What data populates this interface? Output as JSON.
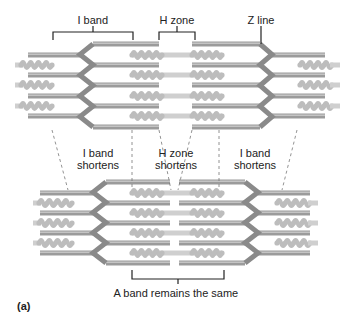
{
  "labels": {
    "top": [
      {
        "id": "i-band",
        "text": "I band",
        "x": 93,
        "y": 14
      },
      {
        "id": "h-zone",
        "text": "H zone",
        "x": 177,
        "y": 14
      },
      {
        "id": "z-line",
        "text": "Z line",
        "x": 261,
        "y": 14
      }
    ],
    "middle": [
      {
        "id": "i-band-shortens-left",
        "line1": "I band",
        "line2": "shortens",
        "x": 98,
        "y": 147
      },
      {
        "id": "h-zone-shortens",
        "line1": "H zone",
        "line2": "shortens",
        "x": 176,
        "y": 147
      },
      {
        "id": "i-band-shortens-right",
        "line1": "I band",
        "line2": "shortens",
        "x": 255,
        "y": 147
      }
    ],
    "bottom": {
      "text": "A band remains the same",
      "x": 176,
      "y": 287
    },
    "panel": "(a)"
  },
  "colors": {
    "thin_filament": "#9b9b9b",
    "thin_highlight": "#c4c4c4",
    "thick_filament": "#cfcfcf",
    "thick_heads": "#bdbdbd",
    "z_line": "#8a8a8a",
    "bracket": "#222222",
    "dashed": "#777777"
  },
  "sarcomeres": [
    {
      "name": "relaxed",
      "rows_outer": [
        44,
        65,
        85,
        106,
        127
      ],
      "rows_inner": [
        55,
        75,
        96,
        116
      ],
      "thick_rows": [
        55,
        75,
        96,
        116
      ],
      "outer_thick_rows": [
        65,
        85,
        106
      ],
      "z_left": {
        "x_outer": 80,
        "x_inner": 93
      },
      "z_right": {
        "x_outer": 272,
        "x_inner": 260
      },
      "thin_left_end": 159,
      "thin_right_start": 192,
      "thick_start": 132,
      "thick_end": 222,
      "outer_left_thin_start": 28,
      "outer_right_thin_end": 325,
      "outer_left_thick": [
        15,
        52
      ],
      "outer_right_thick": [
        300,
        340
      ]
    },
    {
      "name": "contracted",
      "rows_outer": [
        182,
        203,
        223,
        243,
        263
      ],
      "rows_inner": [
        193,
        213,
        233,
        253
      ],
      "thick_rows": [
        193,
        213,
        233,
        253
      ],
      "outer_thick_rows": [
        203,
        223,
        243
      ],
      "z_left": {
        "x_outer": 93,
        "x_inner": 106
      },
      "z_right": {
        "x_outer": 258,
        "x_inner": 245
      },
      "thin_left_end": 170,
      "thin_right_start": 179,
      "thick_start": 132,
      "thick_end": 222,
      "outer_left_thin_start": 40,
      "outer_right_thin_end": 310,
      "outer_left_thick": [
        33,
        72
      ],
      "outer_right_thick": [
        277,
        318
      ]
    }
  ],
  "brackets": {
    "i_band": {
      "x1": 53,
      "x2": 133,
      "y": 32,
      "drop": 8,
      "tick_top": 26
    },
    "h_zone": {
      "x1": 159,
      "x2": 195,
      "y": 32,
      "drop": 8,
      "tick_top": 26
    },
    "z_line_pointer": {
      "x": 261,
      "y1": 26,
      "y2": 44
    },
    "a_band": {
      "x1": 132,
      "x2": 224,
      "y": 279,
      "rise": 9,
      "tick_bottom": 284
    }
  },
  "dashed_lines": [
    {
      "x1": 52,
      "y1": 130,
      "x2": 68,
      "y2": 190
    },
    {
      "x1": 132,
      "y1": 130,
      "x2": 132,
      "y2": 190
    },
    {
      "x1": 159,
      "y1": 130,
      "x2": 171,
      "y2": 190
    },
    {
      "x1": 192,
      "y1": 130,
      "x2": 178,
      "y2": 190
    },
    {
      "x1": 219,
      "y1": 130,
      "x2": 219,
      "y2": 190
    },
    {
      "x1": 297,
      "y1": 130,
      "x2": 282,
      "y2": 190
    }
  ]
}
